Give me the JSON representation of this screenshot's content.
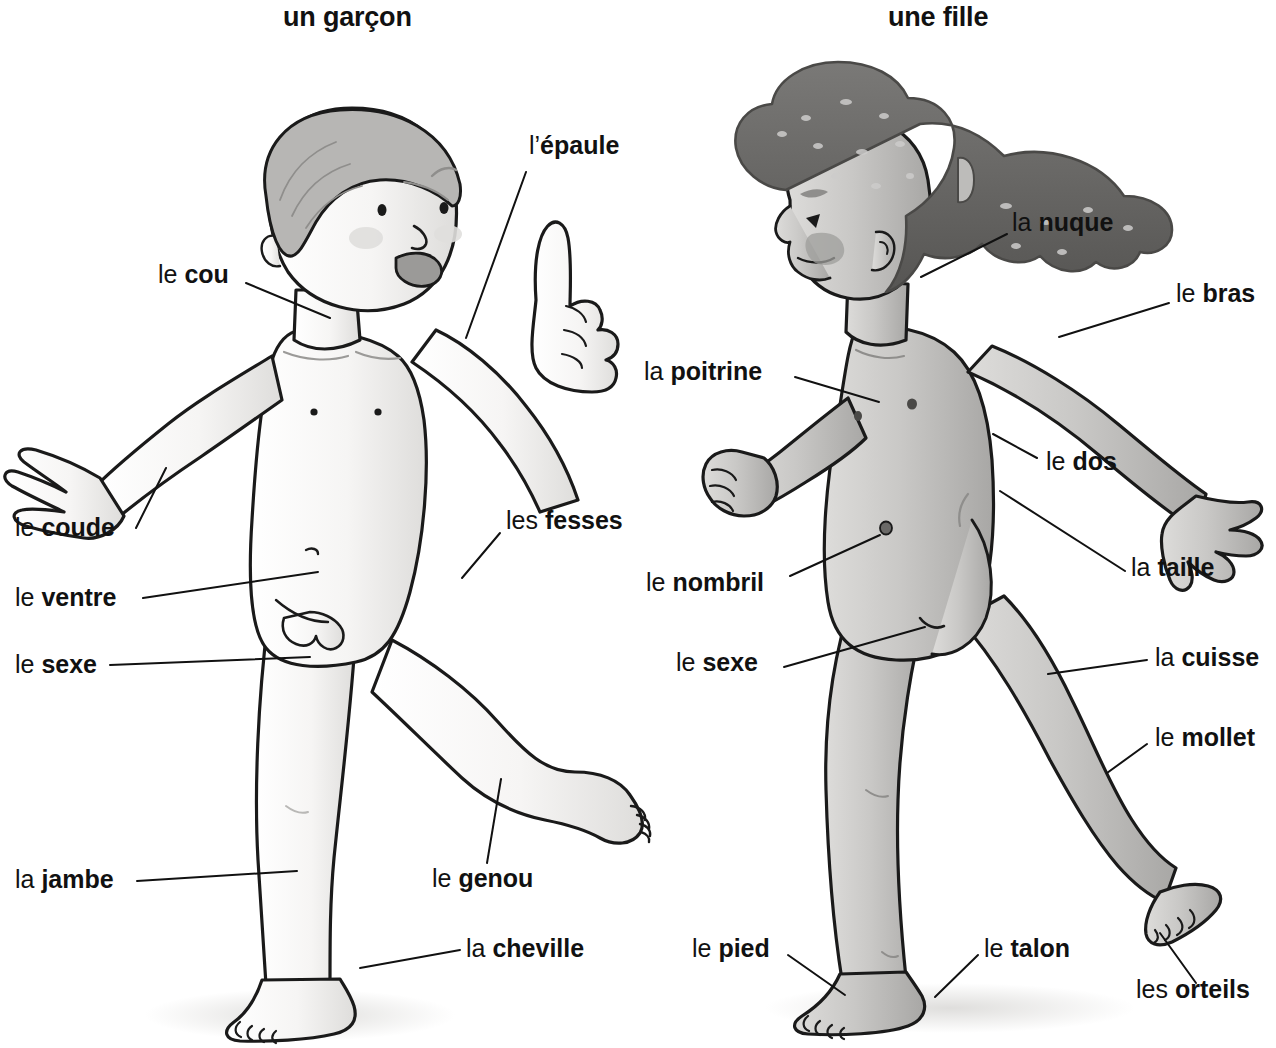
{
  "page": {
    "language": "French",
    "topic": "body-parts-vocabulary",
    "background_color": "#ffffff",
    "ink_color": "#111111"
  },
  "titles": [
    {
      "id": "boy",
      "text": "un garçon"
    },
    {
      "id": "girl",
      "text": "une fille"
    }
  ],
  "figures": {
    "boy": {
      "title": "un garçon",
      "skin_color": "#f3f2f0",
      "shade_color": "#d8d7d5",
      "hair_color": "#b3b2b1",
      "outline_color": "#1a1a1a",
      "pose": "standing, one arm raised, one leg lifted behind"
    },
    "girl": {
      "title": "une fille",
      "skin_color": "#c9c8c6",
      "shade_color": "#a9a8a6",
      "hair_color": "#6a6967",
      "outline_color": "#1a1a1a",
      "pose": "walking in profile facing left, ponytail"
    }
  },
  "labels": {
    "boy": [
      {
        "id": "epaule",
        "article": "l’",
        "noun": "épaule",
        "full": "l’épaule"
      },
      {
        "id": "cou",
        "article": "le ",
        "noun": "cou",
        "full": "le cou"
      },
      {
        "id": "coude",
        "article": "le ",
        "noun": "coude",
        "full": "le coude"
      },
      {
        "id": "ventre",
        "article": "le ",
        "noun": "ventre",
        "full": "le ventre"
      },
      {
        "id": "sexe",
        "article": "le ",
        "noun": "sexe",
        "full": "le sexe"
      },
      {
        "id": "fesses",
        "article": "les ",
        "noun": "fesses",
        "full": "les fesses"
      },
      {
        "id": "jambe",
        "article": "la ",
        "noun": "jambe",
        "full": "la jambe"
      },
      {
        "id": "genou",
        "article": "le ",
        "noun": "genou",
        "full": "le genou"
      },
      {
        "id": "cheville",
        "article": "la ",
        "noun": "cheville",
        "full": "la cheville"
      }
    ],
    "girl": [
      {
        "id": "nuque",
        "article": "la ",
        "noun": "nuque",
        "full": "la nuque"
      },
      {
        "id": "bras",
        "article": "le ",
        "noun": "bras",
        "full": "le bras"
      },
      {
        "id": "poitrine",
        "article": "la ",
        "noun": "poitrine",
        "full": "la poitrine"
      },
      {
        "id": "dos",
        "article": "le ",
        "noun": "dos",
        "full": "le dos"
      },
      {
        "id": "taille",
        "article": "la ",
        "noun": "taille",
        "full": "la taille"
      },
      {
        "id": "nombril",
        "article": "le ",
        "noun": "nombril",
        "full": "le nombril"
      },
      {
        "id": "sexe",
        "article": "le ",
        "noun": "sexe",
        "full": "le sexe"
      },
      {
        "id": "cuisse",
        "article": "la ",
        "noun": "cuisse",
        "full": "la cuisse"
      },
      {
        "id": "mollet",
        "article": "le ",
        "noun": "mollet",
        "full": "le mollet"
      },
      {
        "id": "pied",
        "article": "le ",
        "noun": "pied",
        "full": "le pied"
      },
      {
        "id": "talon",
        "article": "le ",
        "noun": "talon",
        "full": "le talon"
      },
      {
        "id": "orteils",
        "article": "les ",
        "noun": "orteils",
        "full": "les orteils"
      }
    ]
  }
}
